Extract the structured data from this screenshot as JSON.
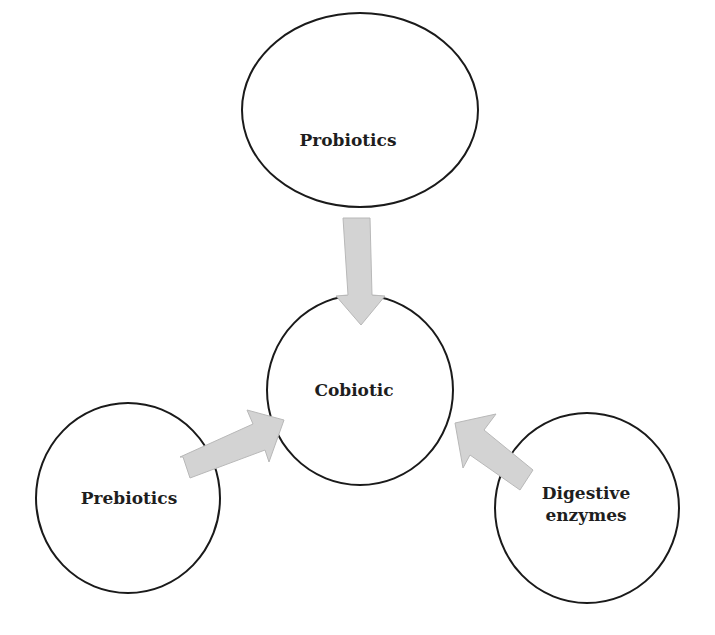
{
  "diagram": {
    "title": "",
    "nodes": [
      {
        "id": "probiotics",
        "label": "Probiotics",
        "shape": "ellipse",
        "cx": 360,
        "cy": 110,
        "rx": 118,
        "ry": 97
      },
      {
        "id": "cobiotic",
        "label": "Cobiotic",
        "shape": "circle",
        "cx": 360,
        "cy": 390,
        "rx": 93,
        "ry": 95
      },
      {
        "id": "prebiotics",
        "label": "Prebiotics",
        "shape": "circle",
        "cx": 128,
        "cy": 498,
        "rx": 92,
        "ry": 95
      },
      {
        "id": "digestive-enzymes",
        "label_line1": "Digestive",
        "label_line2": "enzymes",
        "shape": "circle",
        "cx": 587,
        "cy": 508,
        "rx": 92,
        "ry": 95
      }
    ],
    "edges": [
      {
        "from": "probiotics",
        "to": "cobiotic",
        "style": "block-arrow",
        "color": "#d3d3d3"
      },
      {
        "from": "prebiotics",
        "to": "cobiotic",
        "style": "block-arrow",
        "color": "#d3d3d3"
      },
      {
        "from": "digestive-enzymes",
        "to": "cobiotic",
        "style": "block-arrow",
        "color": "#d3d3d3"
      }
    ]
  }
}
